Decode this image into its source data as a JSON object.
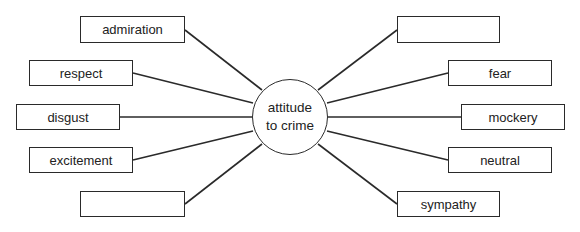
{
  "hub": {
    "line1": "attitude",
    "line2": "to crime"
  },
  "left_boxes": [
    {
      "label": "admiration"
    },
    {
      "label": "respect"
    },
    {
      "label": "disgust"
    },
    {
      "label": "excitement"
    },
    {
      "label": ""
    }
  ],
  "right_boxes": [
    {
      "label": ""
    },
    {
      "label": "fear"
    },
    {
      "label": "mockery"
    },
    {
      "label": "neutral"
    },
    {
      "label": "sympathy"
    }
  ],
  "colors": {
    "line": "#2a2a2a",
    "background": "#ffffff",
    "text": "#222222"
  }
}
